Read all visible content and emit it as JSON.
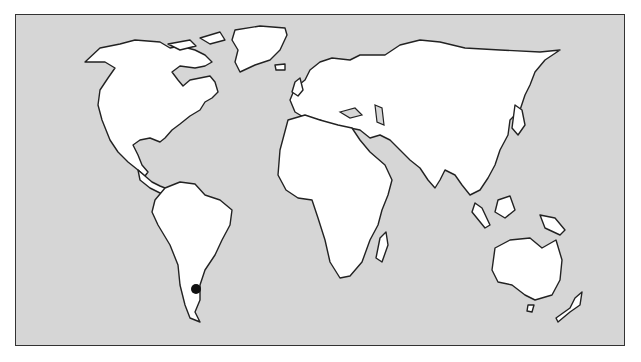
{
  "map": {
    "type": "world-outline",
    "background_color": "#d6d6d6",
    "land_color": "#ffffff",
    "outline_color": "#222222",
    "markers": [
      {
        "name": "location-marker",
        "region": "southern South America (Argentina)",
        "x": 196,
        "y": 289,
        "color": "#111111"
      }
    ]
  }
}
